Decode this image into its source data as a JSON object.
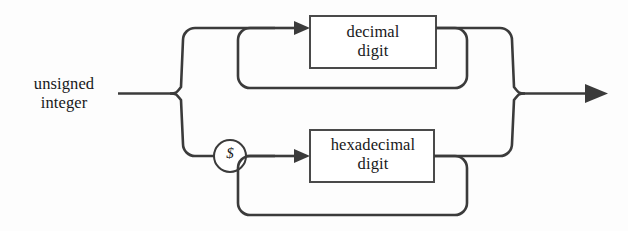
{
  "diagram": {
    "type": "railroad-syntax-diagram",
    "title": "unsigned integer",
    "background_color": "#fdfdfd",
    "line_color": "#3b3b3b",
    "box_fill_color": "#ffffff",
    "text_color": "#18181a",
    "entry": {
      "label": "unsigned\ninteger",
      "line1": "unsigned",
      "line2": "integer"
    },
    "branches": [
      {
        "id": "decimal-branch",
        "position": "upper",
        "nodes": [
          {
            "kind": "nonterminal",
            "name": "decimal-digit-box",
            "label": "decimal\ndigit",
            "line1": "decimal",
            "line2": "digit",
            "repeatable": true
          }
        ]
      },
      {
        "id": "hexadecimal-branch",
        "position": "lower",
        "nodes": [
          {
            "kind": "terminal",
            "name": "dollar-terminal",
            "label": "$"
          },
          {
            "kind": "nonterminal",
            "name": "hexadecimal-digit-box",
            "label": "hexadecimal\ndigit",
            "line1": "hexadecimal",
            "line2": "digit",
            "repeatable": true
          }
        ]
      }
    ],
    "exit": {
      "label": "",
      "arrow": "right-arrow"
    }
  }
}
